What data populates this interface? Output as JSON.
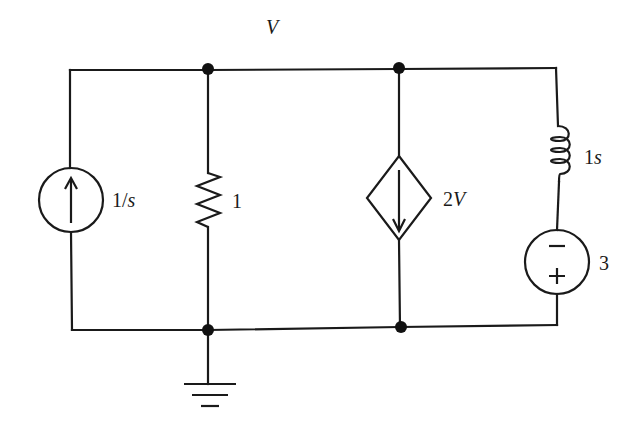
{
  "diagram": {
    "type": "circuit-schematic",
    "node_label": "V",
    "components": [
      {
        "id": "current-source",
        "kind": "independent current source",
        "label": "1/s",
        "label_parts": [
          "1/",
          "s"
        ],
        "direction": "up"
      },
      {
        "id": "resistor",
        "kind": "resistor",
        "label": "1"
      },
      {
        "id": "dependent-current-source",
        "kind": "dependent current source",
        "label": "2V",
        "label_parts": [
          "2",
          "V"
        ],
        "direction": "down"
      },
      {
        "id": "inductor",
        "kind": "inductor",
        "label": "1s",
        "label_parts": [
          "1",
          "s"
        ]
      },
      {
        "id": "voltage-source",
        "kind": "independent voltage source",
        "label": "3",
        "top_sign": "−",
        "bottom_sign": "+"
      },
      {
        "id": "ground",
        "kind": "ground"
      }
    ],
    "nodes": [
      "top-node-1",
      "top-node-2",
      "bottom-node-1",
      "bottom-node-2"
    ],
    "colors": {
      "ink": "#1a1a1a",
      "background": "#ffffff"
    }
  }
}
